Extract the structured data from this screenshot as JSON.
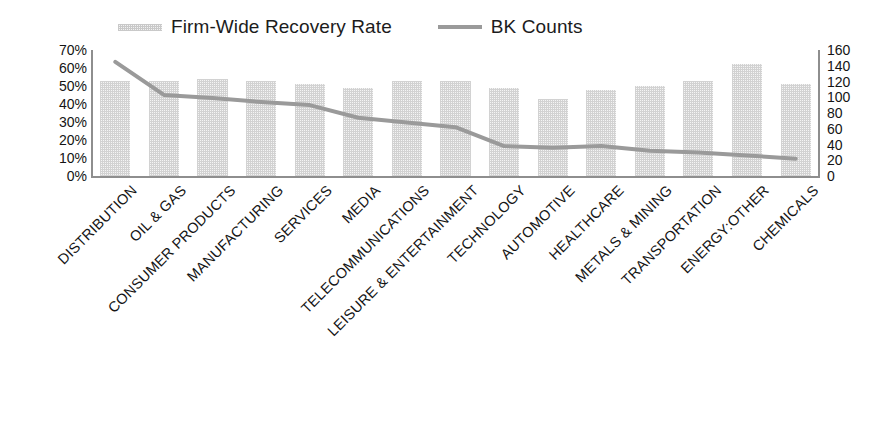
{
  "legend": {
    "items": [
      {
        "label": "Firm-Wide Recovery Rate",
        "marker": "bar-swatch-icon",
        "color": "#d2d2d2"
      },
      {
        "label": "BK Counts",
        "marker": "line-swatch-icon",
        "color": "#9a9a9a"
      }
    ]
  },
  "chart_data": {
    "type": "bar",
    "title": "",
    "subtitle": "",
    "xlabel": "",
    "ylabel": "",
    "grid": false,
    "legend_position": "top",
    "categories": [
      "DISTRIBUTION",
      "OIL & GAS",
      "CONSUMER PRODUCTS",
      "MANUFACTURING",
      "SERVICES",
      "MEDIA",
      "TELECOMMUNICATIONS",
      "LEISURE & ENTERTAINMENT",
      "TECHNOLOGY",
      "AUTOMOTIVE",
      "HEALTHCARE",
      "METALS & MINING",
      "TRANSPORTATION",
      "ENERGY:OTHER",
      "CHEMICALS"
    ],
    "series": [
      {
        "name": "Firm-Wide Recovery Rate",
        "type": "bar",
        "axis": "left",
        "unit": "%",
        "color": "#d2d2d2",
        "values": [
          53,
          53,
          54,
          53,
          51,
          49,
          53,
          53,
          49,
          43,
          48,
          50,
          53,
          62,
          51
        ]
      },
      {
        "name": "BK Counts",
        "type": "line",
        "axis": "right",
        "unit": "",
        "color": "#9a9a9a",
        "values": [
          145,
          103,
          99,
          94,
          90,
          74,
          68,
          62,
          38,
          36,
          38,
          32,
          30,
          26,
          22
        ]
      }
    ],
    "left_axis": {
      "ticks": [
        "70%",
        "60%",
        "50%",
        "40%",
        "30%",
        "20%",
        "10%",
        "0%"
      ],
      "values": [
        70,
        60,
        50,
        40,
        30,
        20,
        10,
        0
      ],
      "ylim": [
        0,
        70
      ],
      "unit": "%"
    },
    "right_axis": {
      "ticks": [
        "160",
        "140",
        "120",
        "100",
        "80",
        "60",
        "40",
        "20",
        "0"
      ],
      "values": [
        160,
        140,
        120,
        100,
        80,
        60,
        40,
        20,
        0
      ],
      "ylim": [
        0,
        160
      ],
      "unit": ""
    }
  }
}
